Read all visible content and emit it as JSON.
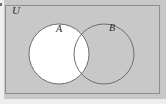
{
  "figure": {
    "name": "venn-diagram-two-sets",
    "type": "venn",
    "universe_label": "U",
    "background_color": "#c8c8c8",
    "border_color": "#8e8e8e",
    "stroke_color": "#6e6e6e",
    "fill_color": "#ffffff",
    "text_color": "#2b2b2b",
    "box": {
      "x": 5,
      "y": 5,
      "width": 155,
      "height": 89
    },
    "sets": [
      {
        "label": "A",
        "cx": 59,
        "cy": 54,
        "r": 30,
        "filled": true,
        "label_x": 56,
        "label_y": 24
      },
      {
        "label": "B",
        "cx": 104,
        "cy": 54,
        "r": 30,
        "filled": false,
        "label_x": 109,
        "label_y": 23
      }
    ]
  }
}
